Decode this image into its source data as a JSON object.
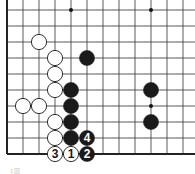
{
  "diagram": {
    "type": "go-board-fragment",
    "grid": {
      "origin_x": 7,
      "origin_y": 10,
      "spacing": 16,
      "cols": 12,
      "rows": 10,
      "left_edge": true,
      "bottom_edge": true,
      "line_color": "#333333",
      "edge_color": "#222222"
    },
    "star_points": [
      {
        "col": 4,
        "row": 0
      },
      {
        "col": 9,
        "row": 0
      },
      {
        "col": 9,
        "row": 6
      }
    ],
    "stones": [
      {
        "color": "white",
        "col": 2,
        "row": 2,
        "label": ""
      },
      {
        "color": "white",
        "col": 3,
        "row": 3,
        "label": ""
      },
      {
        "color": "white",
        "col": 3,
        "row": 4,
        "label": ""
      },
      {
        "color": "white",
        "col": 3,
        "row": 5,
        "label": ""
      },
      {
        "color": "white",
        "col": 1,
        "row": 6,
        "label": ""
      },
      {
        "color": "white",
        "col": 2,
        "row": 6,
        "label": ""
      },
      {
        "color": "white",
        "col": 3,
        "row": 7,
        "label": ""
      },
      {
        "color": "white",
        "col": 3,
        "row": 8,
        "label": ""
      },
      {
        "color": "white",
        "col": 3,
        "row": 9,
        "label": "3"
      },
      {
        "color": "white",
        "col": 4,
        "row": 9,
        "label": "1"
      },
      {
        "color": "black",
        "col": 5,
        "row": 3,
        "label": ""
      },
      {
        "color": "black",
        "col": 4,
        "row": 5,
        "label": ""
      },
      {
        "color": "black",
        "col": 4,
        "row": 6,
        "label": ""
      },
      {
        "color": "black",
        "col": 4,
        "row": 7,
        "label": ""
      },
      {
        "color": "black",
        "col": 4,
        "row": 8,
        "label": ""
      },
      {
        "color": "black",
        "col": 5,
        "row": 8,
        "label": "4"
      },
      {
        "color": "black",
        "col": 5,
        "row": 9,
        "label": "2"
      },
      {
        "color": "black",
        "col": 9,
        "row": 5,
        "label": ""
      },
      {
        "color": "black",
        "col": 9,
        "row": 7,
        "label": ""
      }
    ],
    "caption": "1図"
  }
}
